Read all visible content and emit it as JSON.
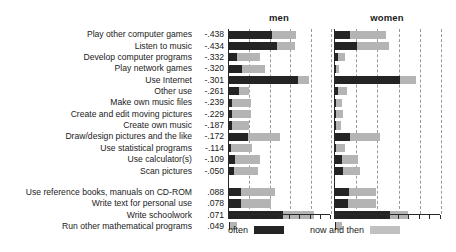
{
  "chart_data": {
    "type": "bar",
    "title": "",
    "subtitle": "",
    "xlabel": "",
    "ylabel": "",
    "orientation": "horizontal",
    "stacked": true,
    "grid": "vertical dashed gridlines",
    "legend_position": "bottom",
    "xlim": [
      0,
      100
    ],
    "xticks_visible_labels": false,
    "panels": [
      "men",
      "women"
    ],
    "legend": [
      "often",
      "now and then"
    ],
    "value_column_header": "",
    "categories": [
      "Play other computer games",
      "Listen to music",
      "Develop computer programs",
      "Play network games",
      "Use Internet",
      "Other use",
      "Make own music files",
      "Create and edit moving pictures",
      "Create own music",
      "Draw/design pictures and the like",
      "Use statistical programs",
      "Use calculator(s)",
      "Scan pictures",
      "Use reference books, manuals on CD-ROM",
      "Write text for personal use",
      "Write  schoolwork",
      "Run other mathematical programs"
    ],
    "loadings": [
      "-.438",
      "-.434",
      "-.332",
      "-.320",
      "-.301",
      "-.261",
      "-.239",
      "-.229",
      "-.187",
      "-.172",
      "-.114",
      "-.109",
      "-.050",
      ".088",
      ".078",
      ".071",
      ".049"
    ],
    "group_break_after_index": 12,
    "series": [
      {
        "name": "often",
        "panel": "men",
        "values": [
          42,
          47,
          8,
          13,
          68,
          10,
          3,
          3,
          3,
          19,
          2,
          6,
          5,
          12,
          12,
          53,
          1
        ]
      },
      {
        "name": "now and then",
        "panel": "men",
        "values": [
          24,
          18,
          22,
          22,
          10,
          10,
          19,
          19,
          17,
          31,
          21,
          24,
          23,
          33,
          29,
          30,
          7
        ]
      },
      {
        "name": "often",
        "panel": "women",
        "values": [
          14,
          21,
          3,
          1,
          61,
          3,
          1,
          1,
          1,
          14,
          1,
          7,
          8,
          13,
          12,
          52,
          1
        ]
      },
      {
        "name": "now and then",
        "panel": "women",
        "values": [
          34,
          30,
          6,
          3,
          15,
          8,
          6,
          7,
          5,
          28,
          8,
          15,
          16,
          26,
          27,
          17,
          6
        ]
      }
    ]
  },
  "headers": {
    "men": "men",
    "women": "women"
  },
  "legend": {
    "often": "often",
    "now_and_then": "now and then"
  },
  "colors": {
    "often": "#242424",
    "now_and_then": "#b4b4b4",
    "gridline": "#9a9a9a",
    "axis": "#2a2a2a",
    "text": "#1b1b1b",
    "background": "#ffffff"
  }
}
